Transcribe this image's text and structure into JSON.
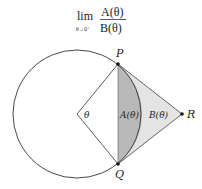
{
  "formula": {
    "lim": "lim",
    "subscript": "θ→0⁺",
    "numerator": "A(θ)",
    "denominator": "B(θ)"
  },
  "labels": {
    "P": "P",
    "Q": "Q",
    "R": "R",
    "theta": "θ",
    "A": "A(θ)",
    "B": "B(θ)"
  },
  "colors": {
    "stroke": "#333333",
    "region_A": "#b9b9b9",
    "region_B": "#e4e4e4",
    "background": "#ffffff"
  }
}
